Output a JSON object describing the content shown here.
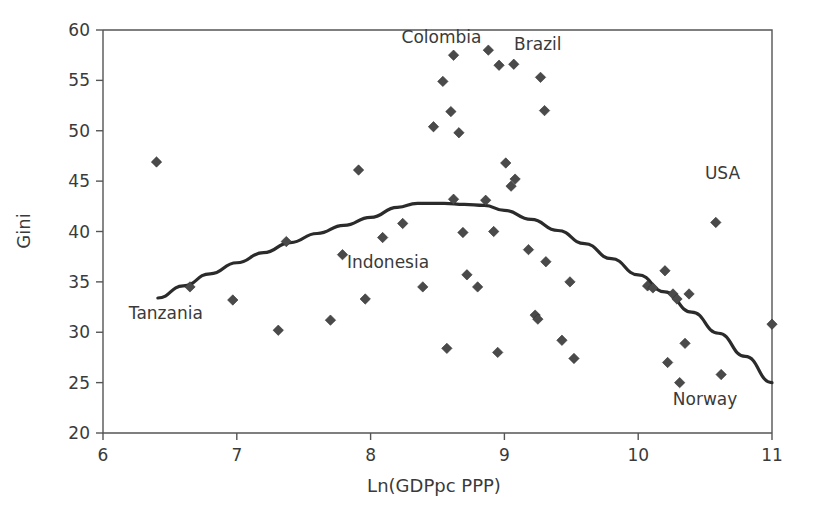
{
  "chart_data": {
    "type": "scatter",
    "title": "",
    "xlabel": "Ln(GDPpc PPP)",
    "ylabel": "Gini",
    "xlim": [
      6,
      11
    ],
    "ylim": [
      20,
      60
    ],
    "xticks": [
      6,
      7,
      8,
      9,
      10,
      11
    ],
    "yticks": [
      20,
      25,
      30,
      35,
      40,
      45,
      50,
      55,
      60
    ],
    "xtick_labels": [
      "6",
      "7",
      "8",
      "9",
      "10",
      "11"
    ],
    "ytick_labels": [
      "20",
      "25",
      "30",
      "35",
      "40",
      "45",
      "50",
      "55",
      "60"
    ],
    "grid": false,
    "legend": "none",
    "marker": "diamond",
    "marker_color": "#4a4a4a",
    "points": [
      {
        "x": 6.4,
        "y": 46.9
      },
      {
        "x": 6.65,
        "y": 34.5
      },
      {
        "x": 6.97,
        "y": 33.2
      },
      {
        "x": 7.31,
        "y": 30.2
      },
      {
        "x": 7.37,
        "y": 39.0
      },
      {
        "x": 7.7,
        "y": 31.2
      },
      {
        "x": 7.79,
        "y": 37.7
      },
      {
        "x": 7.91,
        "y": 46.1
      },
      {
        "x": 7.96,
        "y": 33.3
      },
      {
        "x": 8.09,
        "y": 39.4
      },
      {
        "x": 8.24,
        "y": 40.8
      },
      {
        "x": 8.39,
        "y": 34.5
      },
      {
        "x": 8.47,
        "y": 50.4
      },
      {
        "x": 8.54,
        "y": 54.9
      },
      {
        "x": 8.57,
        "y": 28.4
      },
      {
        "x": 8.6,
        "y": 51.9
      },
      {
        "x": 8.62,
        "y": 43.2
      },
      {
        "x": 8.62,
        "y": 57.5
      },
      {
        "x": 8.66,
        "y": 49.8
      },
      {
        "x": 8.69,
        "y": 39.9
      },
      {
        "x": 8.72,
        "y": 35.7
      },
      {
        "x": 8.8,
        "y": 34.5
      },
      {
        "x": 8.86,
        "y": 43.1
      },
      {
        "x": 8.88,
        "y": 58.0
      },
      {
        "x": 8.92,
        "y": 40.0
      },
      {
        "x": 8.95,
        "y": 28.0
      },
      {
        "x": 8.96,
        "y": 56.5
      },
      {
        "x": 9.01,
        "y": 46.8
      },
      {
        "x": 9.05,
        "y": 44.5
      },
      {
        "x": 9.07,
        "y": 56.6
      },
      {
        "x": 9.08,
        "y": 45.2
      },
      {
        "x": 9.18,
        "y": 38.2
      },
      {
        "x": 9.23,
        "y": 31.7
      },
      {
        "x": 9.25,
        "y": 31.3
      },
      {
        "x": 9.27,
        "y": 55.3
      },
      {
        "x": 9.3,
        "y": 52.0
      },
      {
        "x": 9.31,
        "y": 37.0
      },
      {
        "x": 9.43,
        "y": 29.2
      },
      {
        "x": 9.49,
        "y": 35.0
      },
      {
        "x": 9.52,
        "y": 27.4
      },
      {
        "x": 10.07,
        "y": 34.6
      },
      {
        "x": 10.11,
        "y": 34.4
      },
      {
        "x": 10.2,
        "y": 36.1
      },
      {
        "x": 10.22,
        "y": 27.0
      },
      {
        "x": 10.26,
        "y": 33.8
      },
      {
        "x": 10.29,
        "y": 33.3
      },
      {
        "x": 10.31,
        "y": 25.0
      },
      {
        "x": 10.35,
        "y": 28.9
      },
      {
        "x": 10.38,
        "y": 33.8
      },
      {
        "x": 10.58,
        "y": 40.9
      },
      {
        "x": 10.62,
        "y": 25.8
      },
      {
        "x": 11.0,
        "y": 30.8
      }
    ],
    "annotations": [
      {
        "text": "Colombia",
        "x": 8.53,
        "y": 58.7,
        "anchor": "middle"
      },
      {
        "text": "Brazil",
        "x": 9.25,
        "y": 58.0,
        "anchor": "middle"
      },
      {
        "text": "USA",
        "x": 10.63,
        "y": 45.2,
        "anchor": "middle"
      },
      {
        "text": "Indonesia",
        "x": 8.13,
        "y": 36.4,
        "anchor": "middle"
      },
      {
        "text": "Tanzania",
        "x": 6.47,
        "y": 31.3,
        "anchor": "middle"
      },
      {
        "text": "Norway",
        "x": 10.5,
        "y": 22.8,
        "anchor": "middle"
      }
    ],
    "fit_curve": {
      "name": "quadratic-fit",
      "x_start": 6.41,
      "x_end": 11.0,
      "vertex_x": 8.35,
      "vertex_y": 42.8,
      "points": [
        {
          "x": 6.41,
          "y": 33.4
        },
        {
          "x": 6.6,
          "y": 34.6
        },
        {
          "x": 6.8,
          "y": 35.8
        },
        {
          "x": 7.0,
          "y": 36.9
        },
        {
          "x": 7.2,
          "y": 37.9
        },
        {
          "x": 7.4,
          "y": 38.9
        },
        {
          "x": 7.6,
          "y": 39.8
        },
        {
          "x": 7.8,
          "y": 40.6
        },
        {
          "x": 8.0,
          "y": 41.4
        },
        {
          "x": 8.2,
          "y": 42.4
        },
        {
          "x": 8.35,
          "y": 42.8
        },
        {
          "x": 8.55,
          "y": 42.8
        },
        {
          "x": 8.7,
          "y": 42.7
        },
        {
          "x": 8.85,
          "y": 42.6
        },
        {
          "x": 9.0,
          "y": 42.1
        },
        {
          "x": 9.2,
          "y": 41.2
        },
        {
          "x": 9.4,
          "y": 40.1
        },
        {
          "x": 9.6,
          "y": 38.8
        },
        {
          "x": 9.8,
          "y": 37.3
        },
        {
          "x": 10.0,
          "y": 35.7
        },
        {
          "x": 10.2,
          "y": 34.0
        },
        {
          "x": 10.4,
          "y": 32.0
        },
        {
          "x": 10.6,
          "y": 29.9
        },
        {
          "x": 10.8,
          "y": 27.6
        },
        {
          "x": 11.0,
          "y": 25.0
        }
      ]
    }
  },
  "axes": {
    "x_title": "Ln(GDPpc PPP)",
    "y_title": "Gini"
  }
}
